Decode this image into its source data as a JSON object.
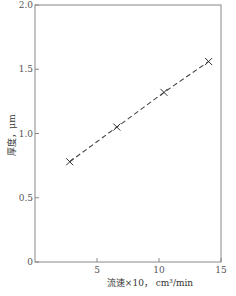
{
  "chart_data": {
    "type": "line",
    "title": "",
    "xlabel": "流速×10， cm³/min",
    "ylabel": "厚度，μm",
    "xlim": [
      0,
      15
    ],
    "ylim": [
      0,
      2.0
    ],
    "xticks": [
      5,
      10,
      15
    ],
    "xtick_labels": [
      "5",
      "10",
      "15"
    ],
    "yticks": [
      0,
      0.5,
      1.0,
      1.5,
      2.0
    ],
    "ytick_labels": [
      "0",
      "0.5",
      "1.0",
      "1.5",
      "2.0"
    ],
    "grid": false,
    "legend": null,
    "series": [
      {
        "name": "厚度",
        "marker": "x",
        "linestyle": "dashed",
        "x": [
          2.8,
          6.6,
          10.4,
          14.0
        ],
        "y": [
          0.78,
          1.05,
          1.32,
          1.56
        ]
      }
    ]
  }
}
